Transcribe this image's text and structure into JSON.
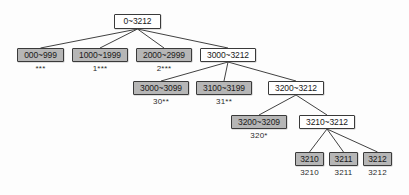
{
  "diagram": {
    "type": "tree",
    "colors": {
      "node_fill_gray": "#b6b6b6",
      "node_fill_white": "#ffffff",
      "node_border": "#3a3a3a",
      "edge": "#2b2b2b",
      "background": "#fdfdfd",
      "text": "#1a1a1a"
    },
    "nodes": [
      {
        "id": "root",
        "label": "0~3212",
        "sublabel": "",
        "fill": "white",
        "x": 114,
        "y": 14,
        "w": 47,
        "h": 15
      },
      {
        "id": "n000_999",
        "label": "000~999",
        "sublabel": "***",
        "fill": "gray",
        "x": 17,
        "y": 48,
        "w": 47,
        "h": 14
      },
      {
        "id": "n1000_1999",
        "label": "1000~1999",
        "sublabel": "1***",
        "fill": "gray",
        "x": 72,
        "y": 48,
        "w": 56,
        "h": 14
      },
      {
        "id": "n2000_2999",
        "label": "2000~2999",
        "sublabel": "2***",
        "fill": "gray",
        "x": 136,
        "y": 48,
        "w": 56,
        "h": 14
      },
      {
        "id": "n3000_3212",
        "label": "3000~3212",
        "sublabel": "",
        "fill": "white",
        "x": 200,
        "y": 48,
        "w": 56,
        "h": 14
      },
      {
        "id": "n3000_3099",
        "label": "3000~3099",
        "sublabel": "30**",
        "fill": "gray",
        "x": 133,
        "y": 81,
        "w": 56,
        "h": 14
      },
      {
        "id": "n3100_3199",
        "label": "3100~3199",
        "sublabel": "31**",
        "fill": "gray",
        "x": 196,
        "y": 81,
        "w": 56,
        "h": 14
      },
      {
        "id": "n3200_3212",
        "label": "3200~3212",
        "sublabel": "",
        "fill": "white",
        "x": 268,
        "y": 81,
        "w": 56,
        "h": 14
      },
      {
        "id": "n3200_3209",
        "label": "3200~3209",
        "sublabel": "320*",
        "fill": "gray",
        "x": 231,
        "y": 115,
        "w": 56,
        "h": 14
      },
      {
        "id": "n3210_3212",
        "label": "3210~3212",
        "sublabel": "",
        "fill": "white",
        "x": 299,
        "y": 115,
        "w": 56,
        "h": 14
      },
      {
        "id": "n3210",
        "label": "3210",
        "sublabel": "3210",
        "fill": "gray",
        "x": 295,
        "y": 152,
        "w": 29,
        "h": 14
      },
      {
        "id": "n3211",
        "label": "3211",
        "sublabel": "3211",
        "fill": "gray",
        "x": 329,
        "y": 152,
        "w": 29,
        "h": 14
      },
      {
        "id": "n3212",
        "label": "3212",
        "sublabel": "3212",
        "fill": "gray",
        "x": 363,
        "y": 152,
        "w": 29,
        "h": 14
      }
    ],
    "edges": [
      {
        "from": "root",
        "to": "n000_999"
      },
      {
        "from": "root",
        "to": "n1000_1999"
      },
      {
        "from": "root",
        "to": "n2000_2999"
      },
      {
        "from": "root",
        "to": "n3000_3212"
      },
      {
        "from": "n3000_3212",
        "to": "n3000_3099"
      },
      {
        "from": "n3000_3212",
        "to": "n3100_3199"
      },
      {
        "from": "n3000_3212",
        "to": "n3200_3212"
      },
      {
        "from": "n3200_3212",
        "to": "n3200_3209"
      },
      {
        "from": "n3200_3212",
        "to": "n3210_3212"
      },
      {
        "from": "n3210_3212",
        "to": "n3210"
      },
      {
        "from": "n3210_3212",
        "to": "n3211"
      },
      {
        "from": "n3210_3212",
        "to": "n3212"
      }
    ]
  }
}
